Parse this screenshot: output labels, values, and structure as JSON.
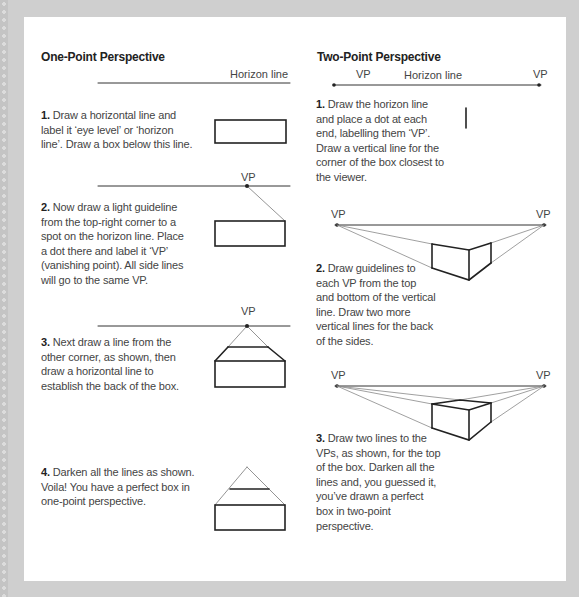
{
  "one_point": {
    "title": "One-Point Perspective",
    "horizon_label": "Horizon line",
    "vp_label": "VP",
    "steps": [
      {
        "num": "1.",
        "text": " Draw a horizontal line and label it ‘eye level’ or ‘horizon line’. Draw a box below this line."
      },
      {
        "num": "2.",
        "text": " Now draw a light guideline from the top-right corner to a spot on the horizon line. Place a dot there and label it ‘VP’ (vanishing point). All side lines will go to the same VP."
      },
      {
        "num": "3.",
        "text": " Next draw a line from the other corner, as shown, then draw a horizontal line to establish the back of the box."
      },
      {
        "num": "4.",
        "text": " Darken all the lines as shown. Voila! You have a perfect box in one-point perspective."
      }
    ]
  },
  "two_point": {
    "title": "Two-Point Perspective",
    "horizon_label": "Horizon line",
    "vp_left_label": "VP",
    "vp_right_label": "VP",
    "steps": [
      {
        "num": "1.",
        "text": " Draw the horizon line and place a dot at each end, labelling them ‘VP’. Draw a vertical line for the corner of the box closest to the viewer."
      },
      {
        "num": "2.",
        "text": " Draw guidelines to each VP from the top and bottom of the vertical line. Draw two more vertical lines for the back of the sides."
      },
      {
        "num": "3.",
        "text": " Draw two lines to the VPs, as shown, for the top of the box. Darken all the lines and, you guessed it, you’ve drawn a perfect box in two-point perspective."
      }
    ]
  },
  "colors": {
    "background": "#cfcfcf",
    "panel": "#ffffff",
    "text": "#444444",
    "heading": "#222222",
    "line_dark": "#2a2a2a",
    "line_light": "#8a8a8a"
  }
}
